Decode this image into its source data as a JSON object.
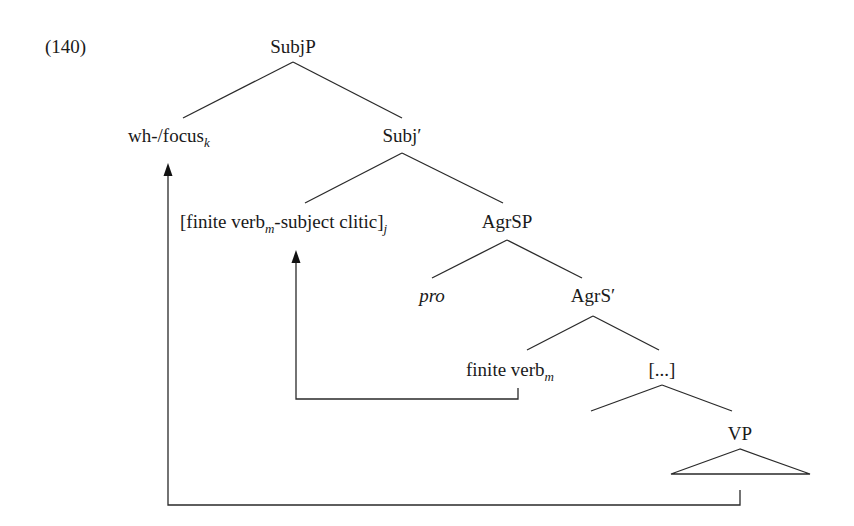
{
  "example_number": "(140)",
  "tree": {
    "root": {
      "label": "SubjP"
    },
    "nodes": {
      "wh_focus": {
        "label": "wh-/focus",
        "subscript": "k"
      },
      "subj_bar": {
        "label": "Subj′"
      },
      "finite_clitic": {
        "label_open": "[finite verb",
        "subscript_m": "m",
        "label_mid": "-subject clitic]",
        "subscript_j": "j"
      },
      "agrsp": {
        "label": "AgrSP"
      },
      "pro": {
        "label": "pro"
      },
      "agrs_bar": {
        "label": "AgrS′"
      },
      "finite_verb": {
        "label": "finite verb",
        "subscript": "m"
      },
      "ellipsis": {
        "label": "[...]"
      },
      "vp": {
        "label": "VP"
      }
    },
    "movements": [
      {
        "from": "VP",
        "to": "wh-/focus_k",
        "index": "k"
      },
      {
        "from": "finite verb_m",
        "to": "[finite verb_m-subject clitic]_j",
        "index": "m"
      }
    ]
  }
}
